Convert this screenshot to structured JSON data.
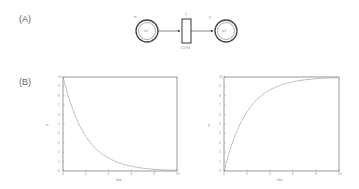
{
  "panels": {
    "a_label": "(A)",
    "b_label": "(B)"
  },
  "petri_net": {
    "place_left": {
      "label_above": "m",
      "label_inside": "m1"
    },
    "transition": {
      "label_above": "T",
      "rate": "0.5*m1"
    },
    "place_right": {
      "label_above": "g",
      "label_inside": "m2"
    }
  },
  "chart_data": [
    {
      "type": "line",
      "title": "",
      "xlabel": "time",
      "ylabel": "m",
      "xlim": [
        0,
        10
      ],
      "ylim": [
        0,
        10
      ],
      "x": [
        0,
        0.5,
        1,
        1.5,
        2,
        2.5,
        3,
        3.5,
        4,
        5,
        6,
        7,
        8,
        9,
        10
      ],
      "series": [
        {
          "name": "m1",
          "values": [
            10,
            7.8,
            6.07,
            4.72,
            3.68,
            2.87,
            2.23,
            1.74,
            1.35,
            0.82,
            0.5,
            0.3,
            0.18,
            0.11,
            0.07
          ]
        }
      ],
      "grid": false
    },
    {
      "type": "line",
      "title": "",
      "xlabel": "time",
      "ylabel": "g",
      "xlim": [
        0,
        10
      ],
      "ylim": [
        0,
        10
      ],
      "x": [
        0,
        0.5,
        1,
        1.5,
        2,
        2.5,
        3,
        3.5,
        4,
        5,
        6,
        7,
        8,
        9,
        10
      ],
      "series": [
        {
          "name": "m2",
          "values": [
            0,
            2.2,
            3.93,
            5.28,
            6.32,
            7.13,
            7.77,
            8.26,
            8.65,
            9.18,
            9.5,
            9.7,
            9.82,
            9.89,
            9.93
          ]
        }
      ],
      "grid": false
    }
  ],
  "axes": {
    "left": {
      "y_ticks": [
        "0",
        "1",
        "2",
        "3",
        "4",
        "5",
        "6",
        "7",
        "8",
        "9",
        "10"
      ],
      "x_ticks": [
        "0",
        "2",
        "4",
        "6",
        "8",
        "10"
      ]
    },
    "right": {
      "y_ticks": [
        "0",
        "1",
        "2",
        "3",
        "4",
        "5",
        "6",
        "7",
        "8",
        "9",
        "10"
      ],
      "x_ticks": [
        "0",
        "2",
        "4",
        "6",
        "8",
        "10"
      ]
    }
  }
}
